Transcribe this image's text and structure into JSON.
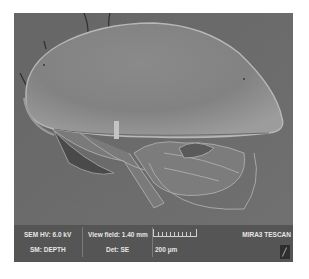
{
  "micrograph": {
    "subject": "ostracod-like specimen, lateral view",
    "palette": {
      "background": "#6b6b6b",
      "shell_light": "#9a9a9a",
      "shell_mid": "#858585",
      "shell_edge": "#b8b8b8",
      "appendage": "#8c8c8c",
      "shadow": "#3f3f3f"
    }
  },
  "info_bar": {
    "hv_label": "SEM HV: 6.0 kV",
    "view_field_label": "View field: 1.40 mm",
    "sm_label": "SM: DEPTH",
    "det_label": "Det: SE",
    "scale_label": "200 µm",
    "instrument_label": "MIRA3 TESCAN",
    "background_color": "#555555",
    "text_color": "#e6e6e6"
  }
}
